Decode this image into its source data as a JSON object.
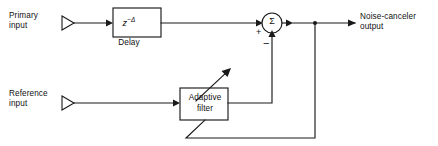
{
  "figure": {
    "kind": "block-diagram",
    "colors": {
      "line": "#1a1a1a",
      "text": "#111111",
      "background": "#ffffff"
    }
  },
  "labels": {
    "primary_input": "Primary\ninput",
    "reference_input": "Reference\ninput",
    "output": "Noise-canceler\noutput",
    "delay_caption": "Delay",
    "delay_z": "z",
    "delay_exponent": "−Δ",
    "adaptive_filter": "Adaptive\nfilter",
    "sum_symbol": "Σ",
    "plus_sign": "+",
    "minus_sign": "−"
  },
  "blocks": [
    {
      "id": "delay",
      "label": "z−Δ",
      "caption": "Delay"
    },
    {
      "id": "adaptive-filter",
      "label": "Adaptive filter"
    },
    {
      "id": "summing-junction",
      "label": "Σ"
    }
  ],
  "signals": [
    {
      "id": "primary-input",
      "label": "Primary input",
      "to": "delay"
    },
    {
      "id": "delay-output",
      "from": "delay",
      "to": "summing-junction",
      "sign": "+"
    },
    {
      "id": "reference-input",
      "label": "Reference input",
      "to": "adaptive-filter"
    },
    {
      "id": "filter-output",
      "from": "adaptive-filter",
      "to": "summing-junction",
      "sign": "−"
    },
    {
      "id": "canceler-output",
      "from": "summing-junction",
      "label": "Noise-canceler output"
    },
    {
      "id": "error-feedback",
      "from": "canceler-output",
      "to": "adaptive-filter"
    },
    {
      "id": "adaptation-arrow",
      "at": "adaptive-filter"
    }
  ]
}
